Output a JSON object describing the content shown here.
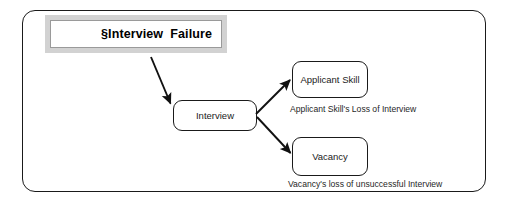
{
  "diagram": {
    "title": {
      "text": "§Interview  Failure"
    },
    "nodes": [
      {
        "id": "interview",
        "label": "Interview"
      },
      {
        "id": "applicant-skill",
        "label": "Applicant Skill"
      },
      {
        "id": "vacancy",
        "label": "Vacancy"
      }
    ],
    "captions": [
      {
        "id": "applicant-skill-caption",
        "text": "Applicant Skill's Loss of Interview"
      },
      {
        "id": "vacancy-caption",
        "text": "Vacancy's loss of unsuccessful Interview"
      }
    ],
    "arrows": [
      {
        "id": "title-to-interview",
        "from": "title",
        "to": "interview"
      },
      {
        "id": "interview-to-applicant-skill",
        "from": "interview",
        "to": "applicant-skill"
      },
      {
        "id": "interview-to-vacancy",
        "from": "interview",
        "to": "vacancy"
      }
    ],
    "colors": {
      "stroke": "#1a1a1a",
      "title_frame": "#d2d2d2",
      "title_inner_rule": "#9a9a9a",
      "background": "#ffffff",
      "text": "#222222"
    }
  }
}
